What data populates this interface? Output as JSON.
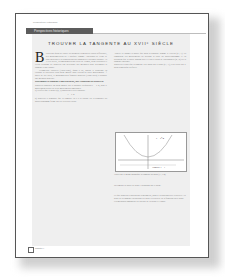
{
  "document": {
    "running_head": "Perspectives Historiques",
    "section_label": "Perspectives historiques",
    "title": "TROUVER LA TANGENTE AU XVIIᵉ SIÈCLE",
    "dropcap": "B",
    "left_column": {
      "paragraphs": [
        "ien avant qu'on ait trouvé les premiers éléments de calcul différentiel, des mathématiciens de l'Antiquité comme Apollonius de Perge se sont intéressés à la construction des tangentes à certaines courbes. Au XVIIe siècle, les mathématiciens Pierre de Fermat, René Descartes et Gilles Personne de Roberval ont développé des méthodes pour déterminer la tangente à une courbe.",
        "Évangelista Torricelli (1608-1647), quant à lui, aborde le problème en étudiant la trajectoire d'un point mobile sous l'action de deux mouvements. À partir de ces idées, le mathématicien français Roberval (1602-1675) a proposé une méthode générale."
      ],
      "subhead": "Déterminer la tangente à une parabole, par l'approche de Roberval",
      "steps": [
        "Roberval considère un point mobile sur la parabole d'équation y = x²/4, dont le mouvement résulte de deux mouvements simultanés.",
        "a) Vérifier que le point P(2, 1) appartient à cette parabole.",
        "b) Roberval a démontré que la tangente en P à la courbe est la diagonale du parallélogramme formé par les vecteurs vitesse."
      ]
    },
    "right_column": {
      "paragraphs": [
        "Appelle ce danger la parole que nous la parabole comme le vecteur (2 ; 1). Ils composent ces mouvements en utilisant la règle du parallélogramme et en déduisent que la droite passant par P et par le point de coordonnées (4 ; 2) est la tangente cherchée.",
        "Roberval a établi que la tangente en P passe par le point (0 ; -1), c'est-à-dire par le point symétrique du foyer."
      ],
      "figure_caption_1": "Tracer sur le même graphique la tangente au point (1 ; 1/4).",
      "figure_caption_2": "Déterminer la droite de pente 1/2 passant par le point.",
      "closing": "Ce que Roberval a obtenu par la géométrie, nous le retrouvons avec la dérivée : la pente de la tangente en un point est égale à la dérivée de la fonction en ce point. Ces méthodes annoncent les travaux de Newton et Leibniz."
    },
    "figure": {
      "curve_label": "y = x²/4",
      "line_label": "Tangente y = 1",
      "x_ticks": [
        "-4",
        "-3",
        "-2",
        "-1",
        "0",
        "1",
        "2",
        "3",
        "4"
      ],
      "y_ticks": [
        "1",
        "2",
        "3"
      ]
    },
    "footer": {
      "text": "Chapitre 4"
    }
  }
}
